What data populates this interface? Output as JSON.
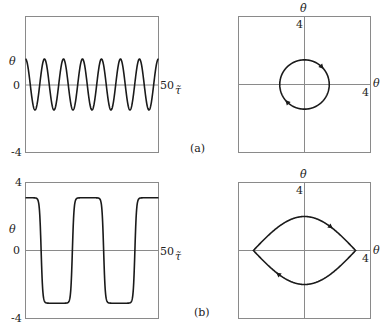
{
  "chart_data": [
    {
      "id": "a-time",
      "type": "line",
      "panel": "(a)",
      "xlabel": "τ̃",
      "ylabel": "θ",
      "xlim": [
        0,
        50
      ],
      "ylim": [
        -4,
        4
      ],
      "x_tick_labels": [
        "50"
      ],
      "y_tick_labels": [
        "0",
        "-4"
      ],
      "series": [
        {
          "name": "theta",
          "kind": "cosine",
          "amplitude": 1.5,
          "period": 7.14,
          "description": "small-amplitude periodic oscillation, ~7 cycles over 0–50"
        }
      ]
    },
    {
      "id": "a-phase",
      "type": "line",
      "panel": "(a)",
      "xlabel": "θ",
      "ylabel": "θ̇",
      "xlim": [
        -4,
        4
      ],
      "ylim": [
        -4,
        4
      ],
      "x_tick_labels": [
        "4"
      ],
      "y_tick_labels": [
        "4"
      ],
      "series": [
        {
          "name": "orbit",
          "kind": "closed-orbit",
          "theta_max": 1.5,
          "thetadot_max": 1.45,
          "direction": "clockwise"
        }
      ]
    },
    {
      "id": "b-time",
      "type": "line",
      "panel": "(b)",
      "xlabel": "τ̃",
      "ylabel": "θ",
      "xlim": [
        0,
        50
      ],
      "ylim": [
        -4,
        4
      ],
      "x_tick_labels": [
        "50"
      ],
      "y_tick_labels": [
        "4",
        "0",
        "-4"
      ],
      "series": [
        {
          "name": "theta",
          "kind": "near-separatrix",
          "amplitude": 3.1,
          "period": 23.5,
          "description": "large-amplitude oscillation with flat plateaus near ±π, ~2 cycles over 0–50"
        }
      ]
    },
    {
      "id": "b-phase",
      "type": "line",
      "panel": "(b)",
      "xlabel": "θ",
      "ylabel": "θ̇",
      "xlim": [
        -4,
        4
      ],
      "ylim": [
        -4,
        4
      ],
      "x_tick_labels": [
        "4"
      ],
      "y_tick_labels": [
        "4"
      ],
      "series": [
        {
          "name": "orbit",
          "kind": "separatrix-like",
          "theta_max": 3.1,
          "thetadot_max": 2.0,
          "direction": "clockwise"
        }
      ]
    }
  ],
  "labels": {
    "theta": "θ",
    "thetadot": "θ̇",
    "tau": "τ̃",
    "zero": "0",
    "four": "4",
    "minus_four": "-4",
    "fifty": "50",
    "panel_a": "(a)",
    "panel_b": "(b)"
  }
}
